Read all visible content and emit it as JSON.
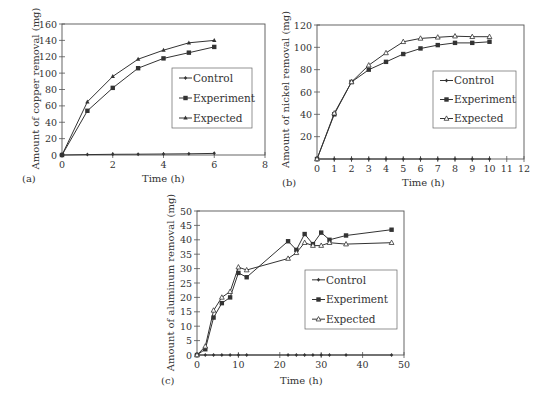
{
  "chart_data": [
    {
      "id": "a",
      "type": "line",
      "panel_label": "(a)",
      "title": "",
      "xlabel": "Time (h)",
      "ylabel": "Amount of copper removal (mg)",
      "xlim": [
        0,
        8
      ],
      "ylim": [
        0,
        160
      ],
      "xticks": [
        0,
        2,
        4,
        6,
        8
      ],
      "yticks": [
        0,
        20,
        40,
        60,
        80,
        100,
        120,
        140,
        160
      ],
      "grid": false,
      "legend_position": "right-middle inside",
      "frame": {
        "left": 62,
        "top": 24,
        "right": 265,
        "bottom": 155
      },
      "legend_box": {
        "x": 172,
        "y": 68,
        "w": 80,
        "h": 60
      },
      "series": [
        {
          "name": "Control",
          "marker": "diamond",
          "x": [
            0,
            1,
            2,
            3,
            4,
            5,
            6
          ],
          "values": [
            0,
            0.5,
            0.8,
            1,
            1.2,
            1.5,
            2
          ]
        },
        {
          "name": "Experiment",
          "marker": "square",
          "x": [
            0,
            1,
            2,
            3,
            4,
            5,
            6
          ],
          "values": [
            0,
            54,
            82,
            106,
            118,
            125,
            132
          ]
        },
        {
          "name": "Expected",
          "marker": "triangle",
          "x": [
            0,
            1,
            2,
            3,
            4,
            5,
            6
          ],
          "values": [
            0,
            65,
            96,
            117,
            128,
            137,
            140
          ]
        }
      ]
    },
    {
      "id": "b",
      "type": "line",
      "panel_label": "(b)",
      "title": "",
      "xlabel": "Time (h)",
      "ylabel": "Amount of nickel removal (mg)",
      "xlim": [
        0,
        12
      ],
      "ylim": [
        0,
        120
      ],
      "xticks": [
        0,
        1,
        2,
        3,
        4,
        5,
        6,
        7,
        8,
        9,
        10,
        11,
        12
      ],
      "yticks": [
        20,
        40,
        60,
        80,
        100,
        120
      ],
      "grid": false,
      "legend_position": "right-middle inside",
      "frame": {
        "left": 317,
        "top": 25,
        "right": 524,
        "bottom": 159
      },
      "legend_box": {
        "x": 433,
        "y": 71,
        "w": 83,
        "h": 57
      },
      "series": [
        {
          "name": "Control",
          "marker": "diamond",
          "x": [
            0,
            1,
            2,
            3,
            4,
            5,
            6,
            7,
            8,
            9,
            10
          ],
          "values": [
            0,
            0,
            0,
            0,
            0,
            0,
            0,
            0,
            0,
            0,
            0
          ]
        },
        {
          "name": "Experiment",
          "marker": "square",
          "x": [
            0,
            1,
            2,
            3,
            4,
            5,
            6,
            7,
            8,
            9,
            10
          ],
          "values": [
            0,
            40,
            69,
            80,
            87,
            94,
            99,
            102,
            104,
            104,
            105
          ]
        },
        {
          "name": "Expected",
          "marker": "triangle-open",
          "x": [
            0,
            1,
            2,
            3,
            4,
            5,
            6,
            7,
            8,
            9,
            10
          ],
          "values": [
            0,
            41,
            69,
            84,
            95,
            105,
            108,
            109,
            110,
            109.5,
            109.5
          ]
        }
      ]
    },
    {
      "id": "c",
      "type": "line",
      "panel_label": "(c)",
      "title": "",
      "xlabel": "Time (h)",
      "ylabel": "Amount of aluminum removal (mg)",
      "xlim": [
        0,
        50
      ],
      "ylim": [
        0,
        50
      ],
      "xticks": [
        0,
        10,
        20,
        30,
        40,
        50
      ],
      "yticks": [
        0,
        5,
        10,
        15,
        20,
        25,
        30,
        35,
        40,
        45,
        50
      ],
      "grid": false,
      "legend_position": "right-middle inside",
      "frame": {
        "left": 197,
        "top": 211,
        "right": 404,
        "bottom": 355
      },
      "legend_box": {
        "x": 305,
        "y": 270,
        "w": 92,
        "h": 59
      },
      "series": [
        {
          "name": "Control",
          "marker": "diamond",
          "x": [
            0,
            2,
            4,
            6,
            8,
            10,
            12,
            22,
            24,
            26,
            28,
            30,
            32,
            36,
            47
          ],
          "values": [
            0,
            0,
            0,
            0,
            0,
            0,
            0,
            0,
            0,
            0,
            0,
            0,
            0,
            0,
            0
          ]
        },
        {
          "name": "Experiment",
          "marker": "square",
          "x": [
            0,
            2,
            4,
            6,
            8,
            10,
            12,
            22,
            24,
            26,
            28,
            30,
            32,
            36,
            47
          ],
          "values": [
            0,
            2,
            13,
            18,
            20,
            28.5,
            27,
            39.5,
            36.5,
            42,
            38.5,
            42.5,
            40,
            41.5,
            43.5
          ]
        },
        {
          "name": "Expected",
          "marker": "triangle-open",
          "x": [
            0,
            2,
            4,
            6,
            8,
            10,
            12,
            22,
            24,
            26,
            28,
            30,
            32,
            36,
            47
          ],
          "values": [
            0,
            3,
            15.5,
            20,
            22,
            30.5,
            29.5,
            33.5,
            35.5,
            39,
            38,
            38,
            39,
            38.5,
            39
          ]
        }
      ]
    }
  ],
  "labels": {
    "a": {
      "panel": "(a)",
      "xlabel": "Time (h)",
      "ylabel": "Amount of copper removal (mg)"
    },
    "b": {
      "panel": "(b)",
      "xlabel": "Time (h)",
      "ylabel": "Amount of nickel removal (mg)"
    },
    "c": {
      "panel": "(c)",
      "xlabel": "Time (h)",
      "ylabel": "Amount of aluminum removal (mg)"
    }
  },
  "legend_labels": [
    "Control",
    "Experiment",
    "Expected"
  ],
  "colors": {
    "line": "#333333",
    "axis": "#555555",
    "text": "#333333"
  }
}
